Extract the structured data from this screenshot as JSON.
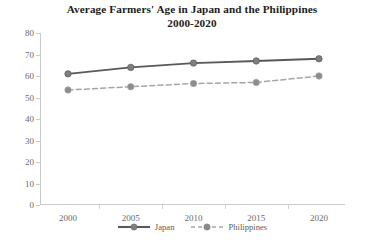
{
  "chart_data": {
    "type": "line",
    "title": "Average Farmers' Age in Japan and the Philippines 2000-2020",
    "title_line1": "Average Farmers' Age in Japan and the Philippines",
    "title_line2": "2000-2020",
    "xlabel": "",
    "ylabel": "",
    "categories": [
      "2000",
      "2005",
      "2010",
      "2015",
      "2020"
    ],
    "x": [
      2000,
      2005,
      2010,
      2015,
      2020
    ],
    "ylim": [
      0,
      80
    ],
    "yticks": [
      "0",
      "10",
      "20",
      "30",
      "40",
      "50",
      "60",
      "70",
      "80"
    ],
    "ytick_values": [
      0,
      10,
      20,
      30,
      40,
      50,
      60,
      70,
      80
    ],
    "grid": false,
    "legend_position": "bottom-center",
    "series": [
      {
        "name": "Japan",
        "values": [
          61,
          64,
          66,
          67,
          68
        ],
        "color": "#595959",
        "line_style": "solid",
        "marker": "circle",
        "marker_color": "#7f7f7f"
      },
      {
        "name": "Philippines",
        "values": [
          53.5,
          55,
          56.5,
          57,
          60
        ],
        "color": "#a6a6a6",
        "line_style": "dashed",
        "marker": "circle",
        "marker_color": "#8c8c8c"
      }
    ]
  },
  "legend": {
    "items": [
      {
        "label": "Japan"
      },
      {
        "label": "Philippines"
      }
    ]
  },
  "colors": {
    "background": "#ffffff",
    "axis": "#c9c9c9",
    "tick_text": "#6a6a6a",
    "title_text": "#1d1d1d",
    "japan": "#595959",
    "philippines": "#a6a6a6"
  }
}
